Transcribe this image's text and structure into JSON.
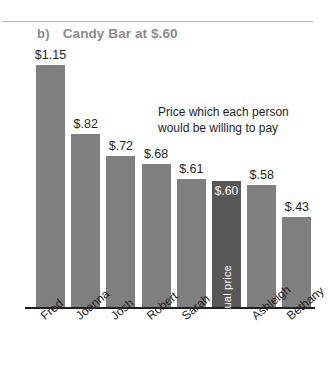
{
  "figure": {
    "panel_marker": "b)",
    "title": "Candy Bar at $.60",
    "annotation_line1": "Price which each person",
    "annotation_line2": "would be willing to pay",
    "actual_price_label": "Actual price",
    "colors": {
      "bar": "#7f7f7f",
      "actual_bar": "#575757",
      "title": "#8c8c8c",
      "axis": "#231f20",
      "rule": "#b3b3b3"
    }
  },
  "chart_data": {
    "type": "bar",
    "title": "b) Candy Bar at $.60",
    "xlabel": "",
    "ylabel": "",
    "ylim": [
      0,
      1.25
    ],
    "grid": false,
    "legend": "none",
    "categories": [
      "Fred",
      "Joanna",
      "Josh",
      "Robert",
      "Sarah",
      "",
      "Ashleigh",
      "Bethany"
    ],
    "values": [
      1.15,
      0.82,
      0.72,
      0.68,
      0.61,
      0.6,
      0.58,
      0.43
    ],
    "value_labels": [
      "$1.15",
      "$.82",
      "$.72",
      "$.68",
      "$.61",
      "$.60",
      "$.58",
      "$.43"
    ],
    "highlight_index": 5,
    "highlight_label": "Actual price",
    "annotation": "Price which each person would be willing to pay",
    "bars": [
      {
        "name": "Fred",
        "value": 1.15,
        "label": "$1.15",
        "actual": false
      },
      {
        "name": "Joanna",
        "value": 0.82,
        "label": "$.82",
        "actual": false
      },
      {
        "name": "Josh",
        "value": 0.72,
        "label": "$.72",
        "actual": false
      },
      {
        "name": "Robert",
        "value": 0.68,
        "label": "$.68",
        "actual": false
      },
      {
        "name": "Sarah",
        "value": 0.61,
        "label": "$.61",
        "actual": false
      },
      {
        "name": "",
        "value": 0.6,
        "label": "$.60",
        "actual": true
      },
      {
        "name": "Ashleigh",
        "value": 0.58,
        "label": "$.58",
        "actual": false
      },
      {
        "name": "Bethany",
        "value": 0.43,
        "label": "$.43",
        "actual": false
      }
    ]
  }
}
